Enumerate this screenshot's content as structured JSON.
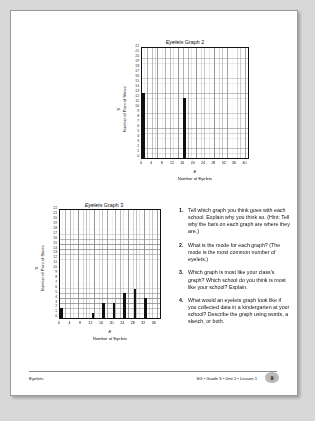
{
  "page": {
    "footer_left": "Eyelets",
    "footer_right": "SG • Grade 5 • Unit 1 • Lesson 1",
    "page_number": "9"
  },
  "graph2": {
    "title_italic": "Eyelets",
    "title_rest": " Graph 2",
    "y_var": "P",
    "y_axis_label": "Number of Pairs of Shoes",
    "x_var": "E",
    "x_axis_label": "Number of Eyelets"
  },
  "graph3": {
    "title_italic": "Eyelets",
    "title_rest": " Graph 3",
    "y_var": "P",
    "y_axis_label": "Number of Pairs of Shoes",
    "x_var": "E",
    "x_axis_label": "Number of Eyelets"
  },
  "questions": [
    {
      "number": "1.",
      "text": "Tell which graph you think goes with each school. Explain why you think so. (Hint: Tell why the bars on each graph are where they are.)"
    },
    {
      "number": "2.",
      "text": "What is the mode for each graph? (The mode is the most common number of eyelets.)"
    },
    {
      "number": "3.",
      "text": "Which graph is most like your class's graph? Which school do you think is most like your school? Explain."
    },
    {
      "number": "4.",
      "text": "What would an eyelets graph look like if you collected data in a kindergarten at your school? Describe the graph using words, a sketch, or both."
    }
  ],
  "chart_data": [
    {
      "type": "bar",
      "title": "Eyelets Graph 2",
      "xlabel": "Number of Eyelets",
      "ylabel": "Number of Pairs of Shoes",
      "x_var": "E",
      "y_var": "P",
      "xlim": [
        0,
        41
      ],
      "ylim": [
        0,
        22
      ],
      "xticks": [
        0,
        4,
        8,
        12,
        16,
        20,
        24,
        28,
        32,
        36,
        40
      ],
      "yticks": [
        0,
        1,
        2,
        3,
        4,
        5,
        6,
        7,
        8,
        9,
        10,
        11,
        12,
        13,
        14,
        15,
        16,
        17,
        18,
        19,
        20,
        21,
        22
      ],
      "grid": true,
      "bar_width_units": 1,
      "x": [
        0,
        16
      ],
      "values": [
        13,
        12
      ]
    },
    {
      "type": "bar",
      "title": "Eyelets Graph 3",
      "xlabel": "Number of Eyelets",
      "ylabel": "Number of Pairs of Shoes",
      "x_var": "E",
      "y_var": "P",
      "xlim": [
        0,
        38
      ],
      "ylim": [
        0,
        22
      ],
      "xticks": [
        0,
        4,
        8,
        12,
        16,
        20,
        24,
        28,
        32,
        36
      ],
      "yticks": [
        0,
        1,
        2,
        3,
        4,
        5,
        6,
        7,
        8,
        9,
        10,
        11,
        12,
        13,
        14,
        15,
        16,
        17,
        18,
        19,
        20,
        21,
        22
      ],
      "grid": true,
      "bar_width_units": 1,
      "x": [
        0,
        12,
        16,
        20,
        24,
        28,
        32
      ],
      "values": [
        2,
        1,
        3,
        3,
        5,
        6,
        4
      ]
    }
  ]
}
